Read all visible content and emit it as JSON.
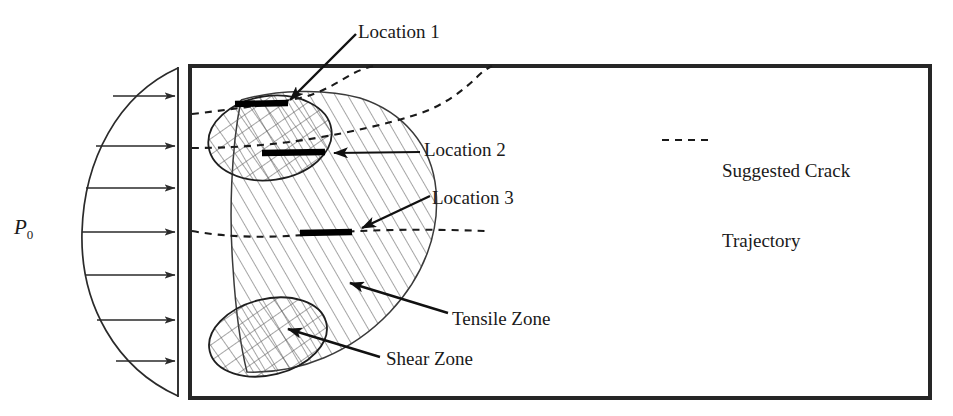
{
  "figure": {
    "kind": "engineering-schematic",
    "labels": {
      "pressure": "P",
      "pressure_subscript": "0",
      "location_1": "Location 1",
      "location_2": "Location 2",
      "location_3": "Location 3",
      "tensile_zone": "Tensile Zone",
      "shear_zone": "Shear Zone",
      "legend_line1": "Suggested Crack",
      "legend_line2": "Trajectory"
    },
    "colors": {
      "ink": "#1a1a1a",
      "frame": "#262626",
      "hatch": "#555555",
      "dash": "#1a1a1a",
      "marker": "#000000",
      "background": "#ffffff"
    },
    "geometry": {
      "frame": {
        "x": 190,
        "y": 66,
        "width": 740,
        "height": 332,
        "stroke_width": 4
      },
      "load_wall": {
        "x": 178,
        "y_top": 68,
        "y_bottom": 396
      },
      "pressure_arrow_rows": [
        96,
        146,
        188,
        232,
        275,
        320,
        361
      ],
      "pressure_arrow_count": 7,
      "tensile_zone_hatch_angle_deg": 30,
      "shear_zone_hatch_angles_deg": [
        35,
        -35
      ],
      "shear_ellipse_top": {
        "cx": 270,
        "cy": 138,
        "rx": 62,
        "ry": 42,
        "rotation_deg": -8
      },
      "shear_ellipse_bottom": {
        "cx": 268,
        "cy": 337,
        "rx": 60,
        "ry": 38,
        "rotation_deg": -14
      },
      "crack_markers": [
        {
          "name": "Location 1",
          "x1": 235,
          "y1": 104,
          "x2": 288,
          "y2": 103
        },
        {
          "name": "Location 2",
          "x1": 262,
          "y1": 153,
          "x2": 325,
          "y2": 152
        },
        {
          "name": "Location 3",
          "x1": 300,
          "y1": 233,
          "x2": 352,
          "y2": 232
        }
      ],
      "legend_dash_sample": {
        "x1": 662,
        "y1": 140,
        "x2": 712,
        "y2": 140
      }
    }
  }
}
